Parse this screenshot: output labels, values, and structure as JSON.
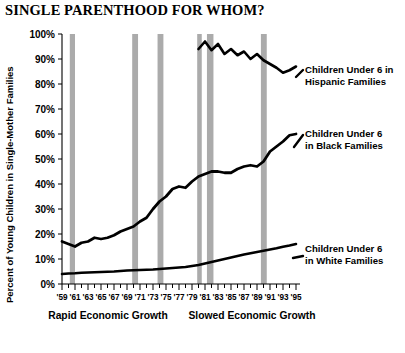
{
  "title": "SINGLE PARENTHOOD FOR WHOM?",
  "axes": {
    "ylabel": "Percent of Young Children in Single-Mother Families",
    "yticks": [
      "0%",
      "10%",
      "20%",
      "30%",
      "40%",
      "50%",
      "60%",
      "70%",
      "80%",
      "90%",
      "100%"
    ],
    "xticks": [
      "'59",
      "'61",
      "'63",
      "'65",
      "'67",
      "'69",
      "'71",
      "'73",
      "'75",
      "'77",
      "'79",
      "'81",
      "'83",
      "'85",
      "'87",
      "'89",
      "'91",
      "'93",
      "'95"
    ]
  },
  "annotations": {
    "era_left": "Rapid Economic Growth",
    "era_right": "Slowed Economic Growth"
  },
  "series_labels": {
    "hispanic_line1": "Children Under 6 in",
    "hispanic_line2": "Hispanic Families",
    "black_line1": "Children Under 6",
    "black_line2": "in Black Families",
    "white_line1": "Children Under 6",
    "white_line2": "in White Families"
  },
  "colors": {
    "line": "#000000",
    "recession_bar": "#ababab",
    "background": "#ffffff"
  },
  "chart_data": {
    "type": "line",
    "title": "SINGLE PARENTHOOD FOR WHOM?",
    "xlabel": "",
    "ylabel": "Percent of Young Children in Single-Mother Families",
    "xlim": [
      1959,
      1995
    ],
    "ylim": [
      0,
      100
    ],
    "grid": false,
    "legend_position": "right-inline-labels",
    "x": [
      1959,
      1960,
      1961,
      1962,
      1963,
      1964,
      1965,
      1966,
      1967,
      1968,
      1969,
      1970,
      1971,
      1972,
      1973,
      1974,
      1975,
      1976,
      1977,
      1978,
      1979,
      1980,
      1981,
      1982,
      1983,
      1984,
      1985,
      1986,
      1987,
      1988,
      1989,
      1990,
      1991,
      1992,
      1993,
      1994,
      1995
    ],
    "series": [
      {
        "name": "Children Under 6 in White Families",
        "values": [
          4.0,
          4.2,
          4.3,
          4.5,
          4.6,
          4.7,
          4.8,
          4.9,
          5.0,
          5.2,
          5.4,
          5.5,
          5.6,
          5.7,
          5.8,
          6.0,
          6.2,
          6.4,
          6.6,
          6.8,
          7.2,
          7.6,
          8.2,
          8.8,
          9.4,
          10.0,
          10.6,
          11.2,
          11.8,
          12.3,
          12.8,
          13.3,
          13.8,
          14.3,
          14.9,
          15.4,
          16.0
        ]
      },
      {
        "name": "Children Under 6 in Black Families",
        "values": [
          17.0,
          16.0,
          15.0,
          16.5,
          17.0,
          18.5,
          18.0,
          18.5,
          19.5,
          21.0,
          22.0,
          23.0,
          25.0,
          26.5,
          30.0,
          33.0,
          35.0,
          38.0,
          39.0,
          38.5,
          41.0,
          43.0,
          44.0,
          45.0,
          45.0,
          44.5,
          44.5,
          46.0,
          47.0,
          47.5,
          47.0,
          49.0,
          53.0,
          55.0,
          57.0,
          59.5,
          60.0
        ]
      },
      {
        "name": "Children Under 6 in Hispanic Families",
        "values": [
          null,
          null,
          null,
          null,
          null,
          null,
          null,
          null,
          null,
          null,
          null,
          null,
          null,
          null,
          null,
          null,
          null,
          null,
          null,
          null,
          null,
          94.0,
          97.0,
          93.5,
          96.0,
          92.0,
          94.0,
          91.5,
          93.0,
          90.0,
          92.0,
          89.5,
          88.0,
          86.5,
          84.5,
          85.5,
          87.0
        ]
      }
    ],
    "recession_bands": [
      {
        "start": 1960.2,
        "end": 1961.0
      },
      {
        "start": 1969.8,
        "end": 1970.7
      },
      {
        "start": 1973.7,
        "end": 1974.6
      },
      {
        "start": 1979.8,
        "end": 1980.5
      },
      {
        "start": 1981.3,
        "end": 1982.3
      },
      {
        "start": 1989.6,
        "end": 1990.5
      }
    ]
  }
}
